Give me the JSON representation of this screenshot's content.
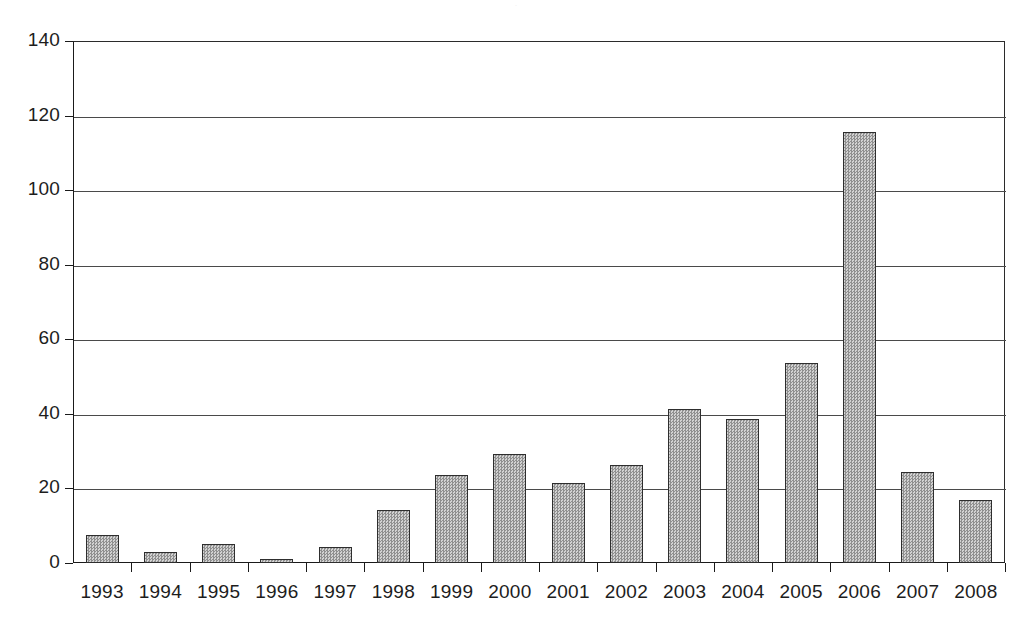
{
  "chart_data": {
    "type": "bar",
    "title": "",
    "subtitle": "",
    "xlabel": "",
    "ylabel": "",
    "categories": [
      "1993",
      "1994",
      "1995",
      "1996",
      "1997",
      "1998",
      "1999",
      "2000",
      "2001",
      "2002",
      "2003",
      "2004",
      "2005",
      "2006",
      "2007",
      "2008"
    ],
    "values": [
      7.5,
      3,
      5,
      1,
      4.3,
      14.2,
      23.7,
      29.2,
      21.4,
      26.2,
      41.2,
      38.7,
      53.7,
      115.7,
      24.3,
      16.8
    ],
    "ylim": [
      0,
      140
    ],
    "yticks": [
      0,
      20,
      40,
      60,
      80,
      100,
      120,
      140
    ],
    "ytick_labels": [
      "0",
      "20",
      "40",
      "60",
      "80",
      "100",
      "120",
      "140"
    ],
    "grid": "horizontal",
    "legend": "none",
    "series_name": "",
    "bar_fill_color": "#b2b2b2",
    "bar_border_color": "#2e2e2e",
    "axis_color": "#1a1a1a",
    "gridline_color": "#4a4a4a",
    "background_color": "#ffffff"
  },
  "title_remnant": "·"
}
